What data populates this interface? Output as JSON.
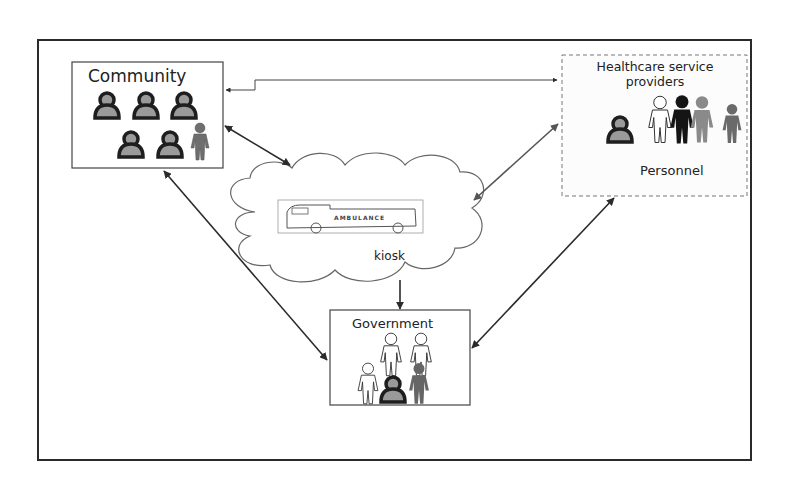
{
  "diagram": {
    "nodes": {
      "community": {
        "title": "Community"
      },
      "healthcare": {
        "title": "Healthcare service providers",
        "subtitle": "Personnel"
      },
      "kiosk": {
        "title": "kiosk",
        "vehicle_text": "AMBULANCE"
      },
      "government": {
        "title": "Government"
      }
    },
    "edges": [
      {
        "from": "community",
        "to": "healthcare",
        "direction": "both"
      },
      {
        "from": "community",
        "to": "kiosk",
        "direction": "both"
      },
      {
        "from": "healthcare",
        "to": "kiosk",
        "direction": "both"
      },
      {
        "from": "kiosk",
        "to": "government",
        "direction": "forward"
      },
      {
        "from": "community",
        "to": "government",
        "direction": "both"
      },
      {
        "from": "healthcare",
        "to": "government",
        "direction": "both"
      }
    ],
    "colors": {
      "frame": "#2a2a2a",
      "arrow": "#2b2b2b",
      "arrow_light": "#555555",
      "person_grey": "#7a7a7a",
      "person_dark": "#1a1a1a"
    }
  }
}
